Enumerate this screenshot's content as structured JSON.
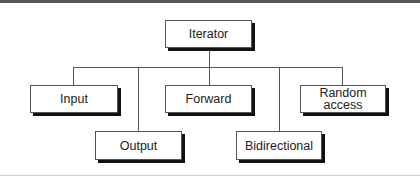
{
  "diagram": {
    "type": "hierarchy",
    "root": {
      "id": "iterator",
      "label": "Iterator"
    },
    "children": [
      {
        "id": "input",
        "label": "Input",
        "row": 1
      },
      {
        "id": "output",
        "label": "Output",
        "row": 2
      },
      {
        "id": "forward",
        "label": "Forward",
        "row": 1
      },
      {
        "id": "bidirectional",
        "label": "Bidirectional",
        "row": 2
      },
      {
        "id": "random-access",
        "label": "Random\naccess",
        "row": 1
      }
    ],
    "edges": [
      [
        "iterator",
        "input"
      ],
      [
        "iterator",
        "output"
      ],
      [
        "iterator",
        "forward"
      ],
      [
        "iterator",
        "bidirectional"
      ],
      [
        "iterator",
        "random-access"
      ]
    ]
  }
}
